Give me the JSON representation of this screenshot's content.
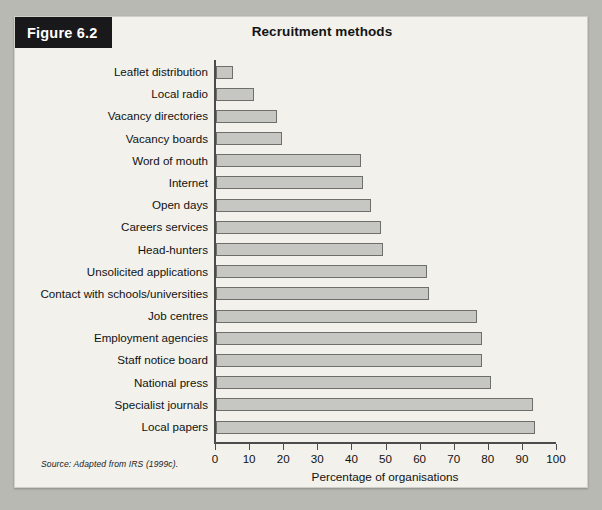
{
  "figure": {
    "badge_label": "Figure 6.2",
    "title": "Recruitment methods",
    "source_note": "Source: Adapted from IRS (1999c)."
  },
  "colors": {
    "badge_background": "#19181a",
    "badge_text": "#ffffff",
    "bar_fill": "#c6c6c2",
    "bar_stroke": "#6e6e6a",
    "card_background": "#f2f1ec",
    "page_background": "#b9b9b4",
    "axis": "#4b4b4b"
  },
  "chart_data": {
    "type": "bar",
    "orientation": "horizontal",
    "title": "Recruitment methods",
    "xlabel": "Percentage of organisations",
    "ylabel": "",
    "xlim": [
      0,
      100
    ],
    "xticks": [
      0,
      10,
      20,
      30,
      40,
      50,
      60,
      70,
      80,
      90,
      100
    ],
    "grid": false,
    "legend": false,
    "categories": [
      "Leaflet distribution",
      "Local radio",
      "Vacancy directories",
      "Vacancy boards",
      "Word of mouth",
      "Internet",
      "Open days",
      "Careers services",
      "Head-hunters",
      "Unsolicited applications",
      "Contact with schools/universities",
      "Job centres",
      "Employment agencies",
      "Staff notice board",
      "National press",
      "Specialist journals",
      "Local papers"
    ],
    "values": [
      5,
      11,
      18,
      19.5,
      42.5,
      43,
      45.5,
      48.5,
      49,
      62,
      62.5,
      76.5,
      78,
      78,
      80.5,
      93,
      93.5
    ]
  }
}
